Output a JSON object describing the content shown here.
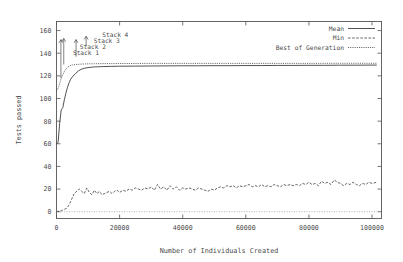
{
  "chart_data": {
    "type": "line",
    "title": "",
    "xlabel": "Number of Individuals Created",
    "ylabel": "Tests passed",
    "xlim": [
      0,
      103000
    ],
    "ylim": [
      -6,
      168
    ],
    "grid": false,
    "legend_position": "top-right",
    "xticks": [
      0,
      20000,
      40000,
      60000,
      80000,
      100000
    ],
    "xtick_labels": [
      "0",
      "20000",
      "40000",
      "60000",
      "80000",
      "100000"
    ],
    "yticks": [
      0,
      20,
      40,
      60,
      80,
      100,
      120,
      140,
      160
    ],
    "ytick_labels": [
      "0",
      "20",
      "40",
      "60",
      "80",
      "100",
      "120",
      "140",
      "160"
    ],
    "series": [
      {
        "name": "Mean",
        "style": "solid",
        "x": [
          0,
          500,
          1000,
          1500,
          2000,
          2500,
          3000,
          3500,
          4000,
          4500,
          5000,
          6000,
          7000,
          8000,
          9000,
          10000,
          11000,
          12000,
          13000,
          14000,
          15000,
          17500,
          20000,
          25000,
          30000,
          35000,
          40000,
          45000,
          50000,
          55000,
          60000,
          65000,
          70000,
          75000,
          80000,
          85000,
          90000,
          95000,
          100000,
          101500
        ],
        "values": [
          60,
          61,
          78,
          90,
          92,
          99,
          105,
          110,
          114,
          117,
          119,
          122,
          124.5,
          126,
          126.8,
          127.3,
          127.6,
          127.9,
          128,
          128.1,
          128.2,
          128.4,
          128.5,
          128.6,
          128.7,
          128.8,
          128.9,
          128.9,
          129,
          129,
          129.1,
          129.1,
          129.2,
          129.2,
          129.3,
          129.3,
          129.4,
          129.4,
          129.5,
          129.5
        ]
      },
      {
        "name": "Min",
        "style": "dashed",
        "x": [
          0,
          800,
          1600,
          2400,
          3200,
          4000,
          4800,
          5600,
          6400,
          7200,
          8000,
          8800,
          9600,
          10400,
          11200,
          12000,
          12800,
          13600,
          14400,
          15200,
          16000,
          16800,
          17600,
          18400,
          19200,
          20000,
          21000,
          22000,
          23000,
          24000,
          25000,
          26000,
          27000,
          28000,
          29000,
          30000,
          31000,
          32000,
          33000,
          34000,
          35000,
          36000,
          37000,
          38000,
          39000,
          40000,
          41000,
          42000,
          43000,
          44000,
          45000,
          46000,
          47000,
          48000,
          49000,
          50000,
          51000,
          52000,
          53000,
          54000,
          55000,
          56000,
          57000,
          58000,
          59000,
          60000,
          61000,
          62000,
          63000,
          64000,
          65000,
          66000,
          67000,
          68000,
          69000,
          70000,
          71000,
          72000,
          73000,
          74000,
          75000,
          76000,
          77000,
          78000,
          79000,
          80000,
          81000,
          82000,
          83000,
          84000,
          85000,
          86000,
          87000,
          88000,
          89000,
          90000,
          91000,
          92000,
          93000,
          94000,
          95000,
          96000,
          97000,
          98000,
          99000,
          100000,
          101500
        ],
        "values": [
          0,
          0.5,
          1,
          2,
          3,
          6,
          11,
          16,
          18,
          20,
          18,
          16,
          21,
          17,
          15,
          19,
          16,
          18,
          15,
          16,
          17,
          18,
          16,
          18,
          19,
          17,
          19,
          18,
          20,
          19,
          21,
          20,
          19,
          21,
          20,
          22,
          19,
          24,
          20,
          22,
          19,
          23,
          20,
          22,
          19,
          21,
          20,
          21,
          20,
          19,
          21,
          20,
          19,
          18,
          20,
          19,
          21,
          22,
          21,
          23,
          22,
          23,
          21,
          23,
          22,
          23,
          24,
          22,
          23,
          22,
          24,
          22,
          23,
          22,
          24,
          23,
          22,
          24,
          23,
          24,
          23,
          24,
          23,
          25,
          24,
          26,
          24,
          25,
          23,
          27,
          25,
          26,
          24,
          28,
          26,
          25,
          23,
          25,
          24,
          26,
          24,
          23,
          25,
          24,
          26,
          25,
          26
        ]
      },
      {
        "name": "Best of Generation",
        "style": "dotted",
        "x": [
          0,
          500,
          1000,
          1500,
          2000,
          2500,
          3000,
          3500,
          4000,
          4500,
          5000,
          6000,
          7000,
          8000,
          9000,
          10000,
          12000,
          14000,
          16000,
          20000,
          25000,
          30000,
          40000,
          50000,
          60000,
          70000,
          80000,
          90000,
          100000,
          101500
        ],
        "values": [
          107,
          109,
          113,
          118,
          121,
          124,
          126,
          127.5,
          128.5,
          129.2,
          129.6,
          130,
          130.2,
          130.4,
          130.5,
          130.6,
          130.7,
          130.8,
          130.8,
          130.9,
          130.9,
          131,
          131,
          131,
          131,
          131,
          131,
          131.1,
          131.1,
          131.1
        ]
      },
      {
        "name": "zero-baseline",
        "style": "dotted-baseline",
        "x": [
          0,
          101500
        ],
        "values": [
          0,
          0
        ]
      }
    ],
    "annotations": [
      {
        "label": "Stack 1",
        "arrow_x": 1400,
        "arrow_y_top": 152,
        "arrow_y_bottom": 118,
        "label_x": 5200,
        "label_y": 140
      },
      {
        "label": "Stack 2",
        "arrow_x": 2300,
        "arrow_y_top": 153,
        "arrow_y_bottom": 130,
        "label_x": 7400,
        "label_y": 146
      },
      {
        "label": "Stack 3",
        "arrow_x": 6200,
        "arrow_y_top": 152,
        "arrow_y_bottom": 137,
        "label_x": 11800,
        "label_y": 151
      },
      {
        "label": "Stack 4",
        "arrow_x": 9400,
        "arrow_y_top": 155,
        "arrow_y_bottom": 146,
        "label_x": 14500,
        "label_y": 156
      }
    ]
  },
  "legend": {
    "entries": [
      {
        "label": "Mean"
      },
      {
        "label": "Min"
      },
      {
        "label": "Best of Generation"
      }
    ]
  }
}
